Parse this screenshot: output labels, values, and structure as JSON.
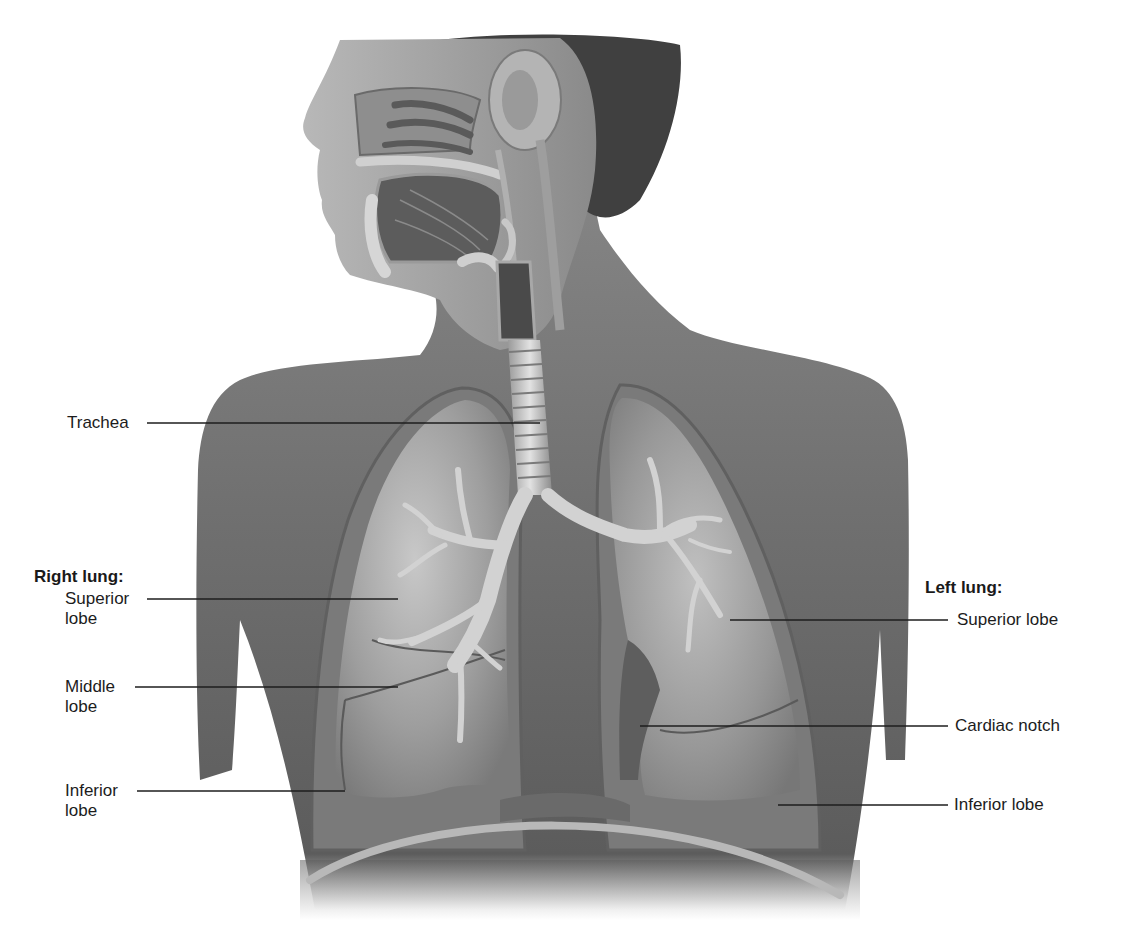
{
  "figure": {
    "colors": {
      "background": "#ffffff",
      "skin_dark": "#5a5a5a",
      "skin_mid": "#7c7c7c",
      "skin_light": "#a8a8a8",
      "lung_fill": "#9b9b9b",
      "lung_light": "#c4c4c4",
      "pleura": "#6e6e6e",
      "cartilage": "#d8d8d8",
      "hair": "#3a3a3a",
      "label_text": "#1c1c1c",
      "leader_line": "#1e1e1e"
    }
  },
  "labels": {
    "trachea": {
      "text": "Trachea"
    },
    "right_lung": {
      "heading": "Right lung:",
      "superior": {
        "line1": "Superior",
        "line2": "lobe"
      },
      "middle": {
        "line1": "Middle",
        "line2": "lobe"
      },
      "inferior": {
        "line1": "Inferior",
        "line2": "lobe"
      }
    },
    "left_lung": {
      "heading": "Left lung:",
      "superior": {
        "text": "Superior lobe"
      },
      "cardiac_notch": {
        "text": "Cardiac notch"
      },
      "inferior": {
        "text": "Inferior lobe"
      }
    }
  }
}
